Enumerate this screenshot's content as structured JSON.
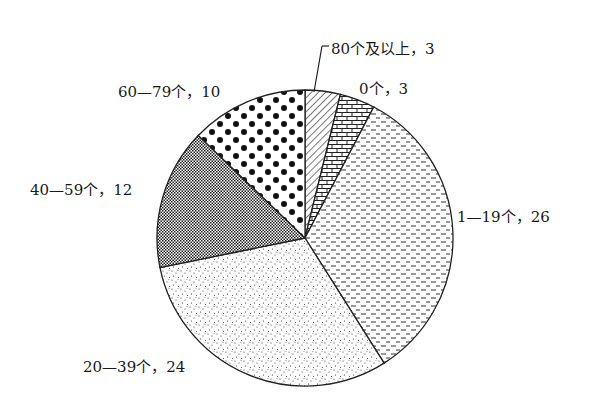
{
  "chart_data": {
    "type": "pie",
    "title": "",
    "start_angle_deg": 0,
    "direction": "clockwise",
    "categories": [
      "80个及以上",
      "0个",
      "1—19个",
      "20—39个",
      "40—59个",
      "60—79个"
    ],
    "values": [
      3,
      3,
      26,
      24,
      12,
      10
    ],
    "patterns": [
      "diagonal-hatch",
      "brick",
      "dashes",
      "fine-dots",
      "crosshatch",
      "large-dots"
    ],
    "labels": [
      {
        "text": "80个及以上，3",
        "x": 331,
        "y": 38,
        "leader": true
      },
      {
        "text": "0个，3",
        "x": 359,
        "y": 77
      },
      {
        "text": "1—19个，26",
        "x": 457,
        "y": 205
      },
      {
        "text": "20—39个，24",
        "x": 83,
        "y": 355
      },
      {
        "text": "40—59个，12",
        "x": 30,
        "y": 178
      },
      {
        "text": "60—79个，10",
        "x": 118,
        "y": 80
      }
    ],
    "center": [
      305,
      238
    ],
    "radius": 148
  }
}
